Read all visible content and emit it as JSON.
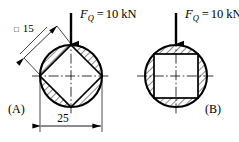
{
  "figure": {
    "title_implicit": "Two cross-sections loaded by a compressive force",
    "background_color": "#ffffff",
    "line_color": "#000000",
    "hatch_color": "#000000",
    "panels": [
      {
        "id": "A",
        "label": "(A)",
        "force": {
          "symbol": "F",
          "subscript": "Q",
          "equals": "=",
          "value": "10",
          "unit": "kN",
          "full_text": "F_Q = 10 kN",
          "direction": "down"
        },
        "outer_shape": "circle",
        "outer_dimension": {
          "value": "25",
          "symbol": "",
          "full_text": "25",
          "placement": "below"
        },
        "inner_shape": "square-rotated-45",
        "inner_dimension": {
          "value": "15",
          "symbol": "□",
          "full_text": "□ 15",
          "placement": "upper-left-diagonal"
        },
        "hatched_region": "between circle and square",
        "centerlines": [
          "horizontal",
          "vertical"
        ]
      },
      {
        "id": "B",
        "label": "(B)",
        "force": {
          "symbol": "F",
          "subscript": "Q",
          "equals": "=",
          "value": "10",
          "unit": "kN",
          "full_text": "F_Q = 10 kN",
          "direction": "down"
        },
        "outer_shape": "circle",
        "outer_dimension": null,
        "inner_shape": "square-axis-aligned",
        "inner_dimension": null,
        "hatched_region": "between circle and square",
        "centerlines": [
          "horizontal",
          "vertical"
        ]
      }
    ]
  }
}
